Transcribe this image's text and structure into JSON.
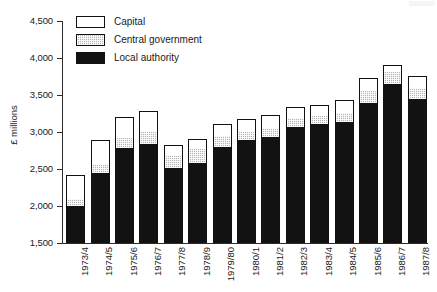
{
  "chart_data": {
    "type": "bar",
    "subtype": "stacked-vertical",
    "title": "",
    "subtitle": "",
    "xlabel": "",
    "ylabel": "£ millions",
    "ylim": [
      1500,
      4500
    ],
    "ytick_values": [
      1500,
      2000,
      2500,
      3000,
      3500,
      4000,
      4500
    ],
    "ytick_labels": [
      "1,500",
      "2,000",
      "2,500",
      "3,000",
      "3,500",
      "4,000",
      "4,500"
    ],
    "grid": false,
    "legend_position": "top-left",
    "categories": [
      "1973/4",
      "1974/5",
      "1975/6",
      "1976/7",
      "1977/8",
      "1978/9",
      "1979/80",
      "1980/1",
      "1981/2",
      "1982/3",
      "1983/4",
      "1984/5",
      "1985/6",
      "1986/7",
      "1987/8"
    ],
    "series": [
      {
        "name": "Local authority",
        "color": "#121212",
        "values": [
          2000,
          2440,
          2780,
          2835,
          2520,
          2585,
          2795,
          2890,
          2930,
          3070,
          3115,
          3130,
          3390,
          3655,
          3440
        ]
      },
      {
        "name": "Central government",
        "color": "#b5b5b5",
        "values": [
          90,
          110,
          145,
          175,
          175,
          185,
          150,
          105,
          110,
          120,
          105,
          125,
          170,
          155,
          140
        ]
      },
      {
        "name": "Capital",
        "color": "#ffffff",
        "values": [
          330,
          340,
          275,
          275,
          130,
          140,
          170,
          185,
          190,
          150,
          140,
          175,
          175,
          100,
          180
        ]
      }
    ],
    "totals": [
      2420,
      2890,
      3200,
      3285,
      2825,
      2910,
      3115,
      3180,
      3230,
      3340,
      3360,
      3430,
      3735,
      3910,
      3760
    ]
  },
  "legend": {
    "items": [
      {
        "label": "Capital",
        "swatch": "capital-swatch"
      },
      {
        "label": "Central government",
        "swatch": "central-government-swatch"
      },
      {
        "label": "Local authority",
        "swatch": "local-authority-swatch"
      }
    ]
  },
  "axes": {
    "y_title": "£ millions"
  }
}
